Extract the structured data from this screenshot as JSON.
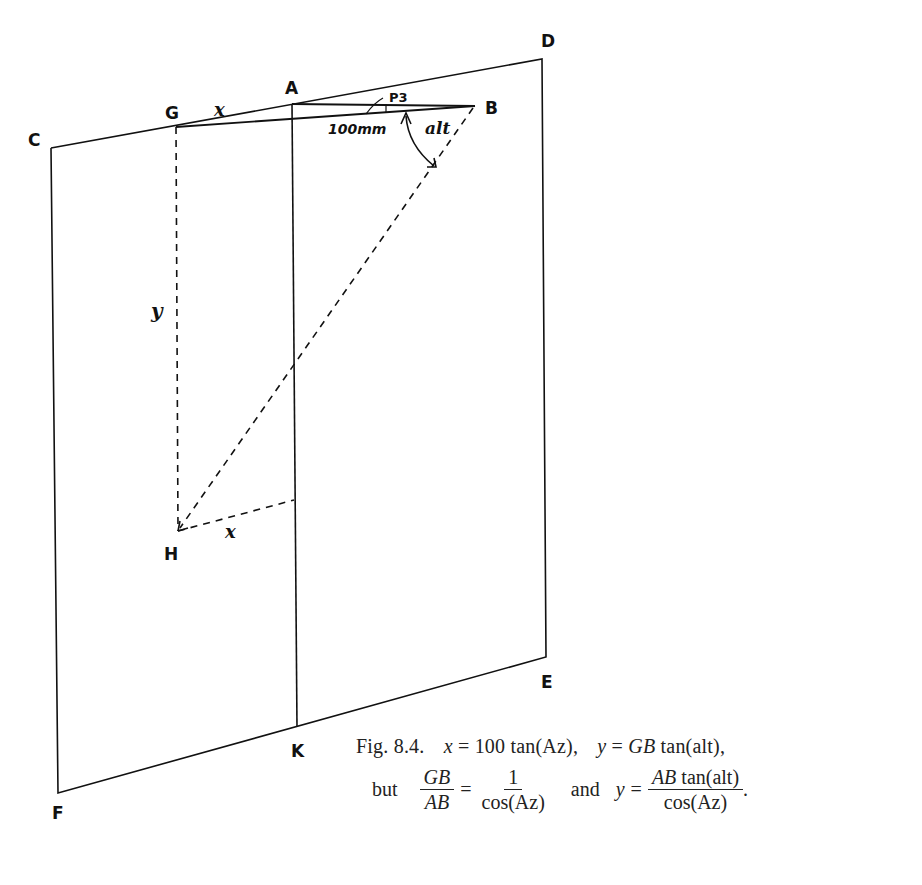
{
  "diagram": {
    "points": {
      "A": "A",
      "B": "B",
      "C": "C",
      "D": "D",
      "E": "E",
      "F": "F",
      "G": "G",
      "H": "H",
      "K": "K"
    },
    "annotations": {
      "x_top": "x",
      "x_bottom": "x",
      "y": "y",
      "length": "100mm",
      "p3": "P3",
      "alt": "alt"
    }
  },
  "caption": {
    "fig": "Fig. 8.4.",
    "eq1_lhs": "x",
    "eq1_rhs": "= 100 tan(Az),",
    "eq2_lhs": "y",
    "eq2_eq": "=",
    "eq2_gb": "GB",
    "eq2_rhs": "tan(alt),",
    "but": "but",
    "frac1_num": "GB",
    "frac1_den": "AB",
    "eq_sign": "=",
    "frac2_num": "1",
    "frac2_den": "cos(Az)",
    "and": "and",
    "eq3_lhs": "y",
    "eq3_eq": "=",
    "frac3_num_it": "AB",
    "frac3_num_rest": " tan(alt)",
    "frac3_den": "cos(Az)",
    "period": "."
  }
}
